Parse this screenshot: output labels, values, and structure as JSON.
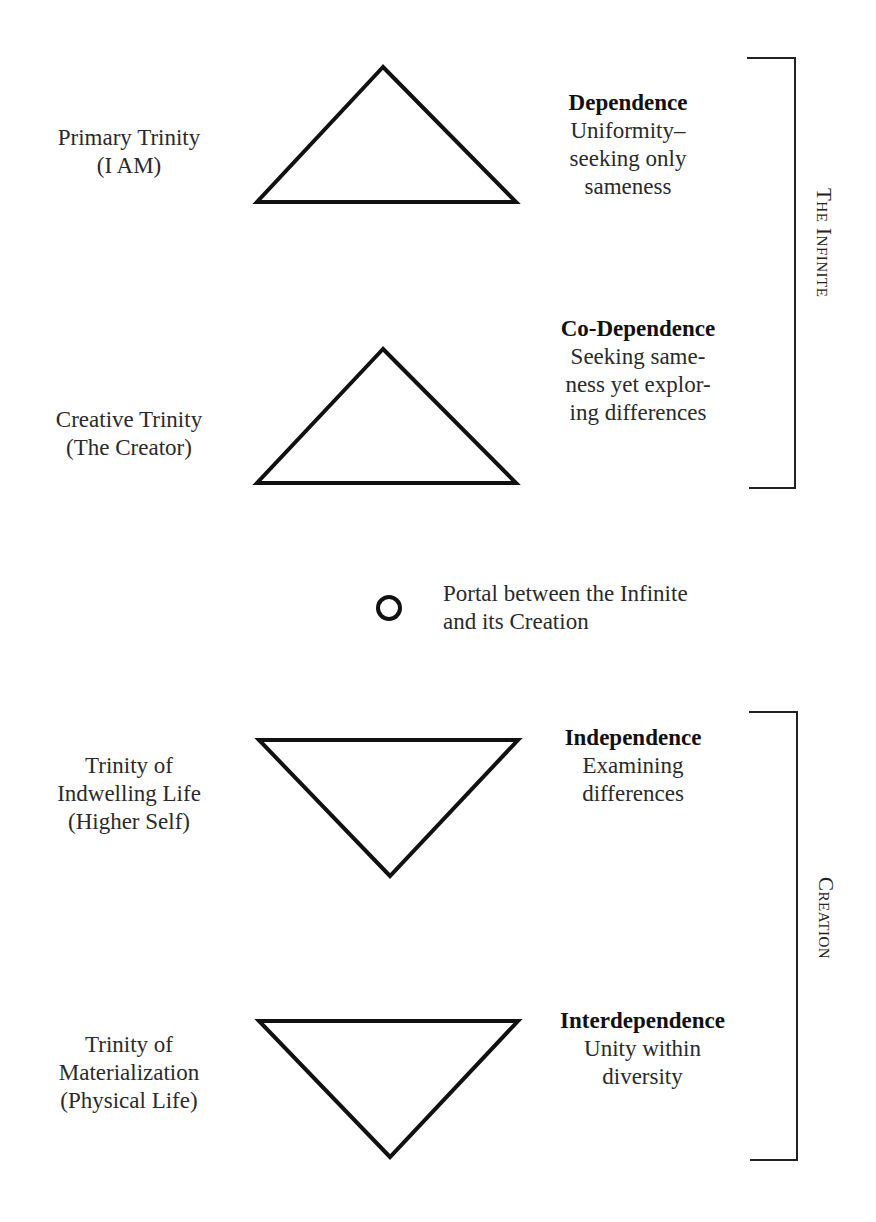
{
  "levels": [
    {
      "left": [
        "Primary Trinity",
        "(I AM)"
      ],
      "title": "Dependence",
      "desc": [
        "Uniformity–",
        "seeking only",
        "sameness"
      ],
      "orientation": "up"
    },
    {
      "left": [
        "Creative Trinity",
        "(The Creator)"
      ],
      "title": "Co-Dependence",
      "desc": [
        "Seeking same-",
        "ness yet explor-",
        "ing differences"
      ],
      "orientation": "up"
    },
    {
      "left": [
        "Trinity of",
        "Indwelling Life",
        "(Higher Self)"
      ],
      "title": "Independence",
      "desc": [
        "Examining",
        "differences"
      ],
      "orientation": "down"
    },
    {
      "left": [
        "Trinity of",
        "Materialization",
        "(Physical Life)"
      ],
      "title": "Interdependence",
      "desc": [
        "Unity within",
        "diversity"
      ],
      "orientation": "down"
    }
  ],
  "portal": {
    "lines": [
      "Portal between the Infinite",
      "and its Creation"
    ]
  },
  "brackets": {
    "infinite": "The Infinite",
    "creation": "Creation"
  }
}
